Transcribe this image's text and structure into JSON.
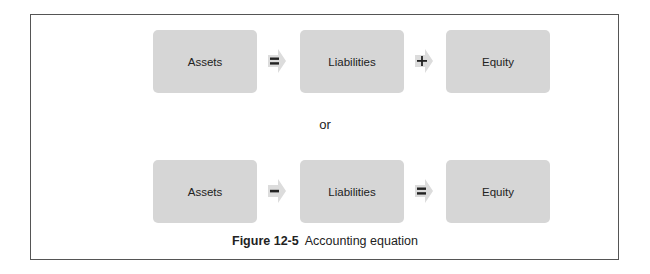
{
  "diagram": {
    "rows": [
      {
        "terms": [
          "Assets",
          "Liabilities",
          "Equity"
        ],
        "operators": [
          {
            "symbol": "=",
            "name": "equals"
          },
          {
            "symbol": "+",
            "name": "plus"
          }
        ]
      },
      {
        "terms": [
          "Assets",
          "Liabilities",
          "Equity"
        ],
        "operators": [
          {
            "symbol": "−",
            "name": "minus"
          },
          {
            "symbol": "=",
            "name": "equals"
          }
        ]
      }
    ],
    "separator": "or",
    "caption": {
      "number": "Figure 12-5",
      "title": "Accounting equation"
    },
    "colors": {
      "box_fill": "#d6d6d6",
      "arrow_fill": "#dcdcdc",
      "border": "#555555",
      "text": "#222222"
    }
  }
}
